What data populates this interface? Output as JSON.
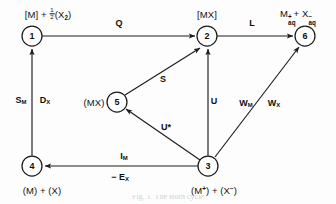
{
  "figure": {
    "type": "reaction-scheme-graph",
    "width": 336,
    "height": 204,
    "background_color": "#fdfdfd",
    "ink_color": "#1c1c1c",
    "caption_partial": "Fig. 1. The Born cycle"
  },
  "nodes": [
    {
      "id": "1",
      "number": "1",
      "cx": 32,
      "cy": 36,
      "r": 10,
      "label_position": "above",
      "label_x": 46,
      "label_y": 14
    },
    {
      "id": "2",
      "number": "2",
      "cx": 207,
      "cy": 36,
      "r": 10,
      "label_position": "above",
      "label_x": 207,
      "label_y": 14
    },
    {
      "id": "6",
      "number": "6",
      "cx": 305,
      "cy": 36,
      "r": 10,
      "label_position": "above",
      "label_x": 297,
      "label_y": 12
    },
    {
      "id": "5",
      "number": "5",
      "cx": 117,
      "cy": 102,
      "r": 10,
      "label_position": "left",
      "label_x": 95,
      "label_y": 102
    },
    {
      "id": "4",
      "number": "4",
      "cx": 32,
      "cy": 166,
      "r": 10,
      "label_position": "below",
      "label_x": 42,
      "label_y": 190
    },
    {
      "id": "3",
      "number": "3",
      "cx": 208,
      "cy": 166,
      "r": 10,
      "label_position": "below",
      "label_x": 214,
      "label_y": 190
    }
  ],
  "node_labels": {
    "n1": "[M] + ½(X₂)",
    "n2": "[MX]",
    "n6": "M⁺ₐৠ + X⁻ₐৠ",
    "n5": "(MX)",
    "n4": "(M) + (X)",
    "n3": "(M⁺) + (X⁻)"
  },
  "edges": [
    {
      "id": "e-1-2",
      "from": "1",
      "to": "2",
      "label": "Q",
      "label_x": 119,
      "label_y": 23,
      "arrow": "end"
    },
    {
      "id": "e-2-6",
      "from": "2",
      "to": "6",
      "label": "L",
      "label_x": 252,
      "label_y": 23,
      "arrow": "end"
    },
    {
      "id": "e-4-1",
      "from": "4",
      "to": "1",
      "label_left": "S",
      "label_left_sub": "M",
      "label_right": "D",
      "label_right_sub": "X",
      "label_x": 33,
      "label_y": 99,
      "arrow": "end"
    },
    {
      "id": "e-5-2",
      "from": "5",
      "to": "2",
      "label": "S",
      "label_x": 163,
      "label_y": 79,
      "arrow": "end"
    },
    {
      "id": "e-3-2",
      "from": "3",
      "to": "2",
      "label": "U",
      "label_x": 214,
      "label_y": 101,
      "arrow": "end"
    },
    {
      "id": "e-3-5",
      "from": "3",
      "to": "5",
      "label": "U*",
      "label_x": 165,
      "label_y": 127,
      "arrow": "end"
    },
    {
      "id": "e-3-6",
      "from": "3",
      "to": "6",
      "label_left": "W",
      "label_left_sub": "M",
      "label_right": "W",
      "label_right_sub": "X",
      "label_x": 258,
      "label_y": 103,
      "arrow": "end"
    },
    {
      "id": "e-3-4",
      "from": "3",
      "to": "4",
      "label_above": "I",
      "label_above_sub": "M",
      "label_below": "− E",
      "label_below_sub": "X",
      "label_x": 124,
      "label_y": 157,
      "label_below_x": 120,
      "label_below_y": 176,
      "arrow": "end"
    }
  ],
  "edge_labels": {
    "Q": "Q",
    "L": "L",
    "S": "S",
    "U": "U",
    "U_star": "U*",
    "S_M": "S",
    "S_M_sub": "M",
    "D_X": "D",
    "D_X_sub": "X",
    "W_M": "W",
    "W_M_sub": "M",
    "W_X": "W",
    "W_X_sub": "X",
    "I_M": "I",
    "I_M_sub": "M",
    "E_X": "− E",
    "E_X_sub": "X"
  },
  "node_numbers": {
    "n1": "1",
    "n2": "2",
    "n3": "3",
    "n4": "4",
    "n5": "5",
    "n6": "6"
  }
}
